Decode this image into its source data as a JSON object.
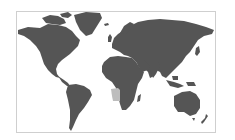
{
  "map": {
    "type": "world-locator-map",
    "projection": "Miller cylindrical",
    "highlighted_region": "Angola",
    "colors": {
      "land": "#555555",
      "highlight": "#bdbdbd",
      "water": "#ffffff",
      "frame_border": "#cfcfcf"
    }
  }
}
